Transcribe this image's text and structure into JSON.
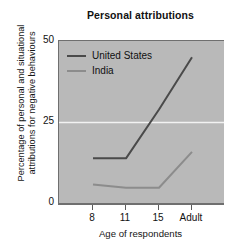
{
  "chart_data": {
    "type": "line",
    "title": "Personal attributions",
    "xlabel": "Age of respondents",
    "ylabel_line1": "Percentage of personal and situational",
    "ylabel_line2": "attributions for negative behaviours",
    "categories": [
      "8",
      "11",
      "15",
      "Adult"
    ],
    "xticklabels": [
      "8",
      "11",
      "15",
      "Adult"
    ],
    "yticklabels": [
      "0",
      "25",
      "50"
    ],
    "yticks": [
      0,
      25,
      50
    ],
    "ylim": [
      0,
      50
    ],
    "grid": "horizontal-gridline-at-25",
    "legend_position": "upper-left-inside",
    "series": [
      {
        "name": "United States",
        "color": "#4a4a4a",
        "values": [
          14,
          14,
          29,
          45
        ]
      },
      {
        "name": "India",
        "color": "#8c8c8c",
        "values": [
          6,
          5,
          5,
          16
        ]
      }
    ]
  },
  "style": {
    "plot_background": "#b9b9b9",
    "page_background": "#ffffff",
    "axis_color": "#6f6f6f",
    "gridline_color": "#f2f2f2",
    "text_color": "#111111"
  }
}
